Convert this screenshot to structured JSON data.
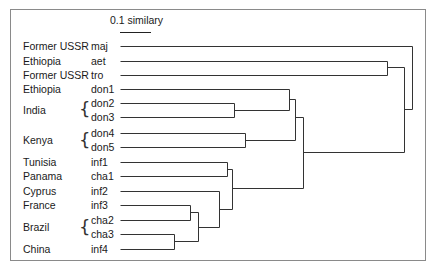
{
  "diagram": {
    "type": "dendrogram",
    "scale": {
      "label": "0.1 similary",
      "bar_length_px": 31
    },
    "leaves": [
      {
        "country": "Former USSR",
        "code": "maj"
      },
      {
        "country": "Ethiopia",
        "code": "aet"
      },
      {
        "country": "Former USSR",
        "code": "tro"
      },
      {
        "country": "Ethiopia",
        "code": "don1"
      },
      {
        "country": "",
        "code": "don2"
      },
      {
        "country": "",
        "code": "don3"
      },
      {
        "country": "",
        "code": "don4"
      },
      {
        "country": "",
        "code": "don5"
      },
      {
        "country": "Tunisia",
        "code": "inf1"
      },
      {
        "country": "Panama",
        "code": "cha1"
      },
      {
        "country": "Cyprus",
        "code": "inf2"
      },
      {
        "country": "France",
        "code": "inf3"
      },
      {
        "country": "",
        "code": "cha2"
      },
      {
        "country": "",
        "code": "cha3"
      },
      {
        "country": "China",
        "code": "inf4"
      }
    ],
    "group_labels": [
      {
        "country": "India",
        "codes": [
          "don2",
          "don3"
        ]
      },
      {
        "country": "Kenya",
        "codes": [
          "don4",
          "don5"
        ]
      },
      {
        "country": "Brazil",
        "codes": [
          "cha2",
          "cha3"
        ]
      }
    ],
    "clusters": [
      {
        "members": [
          "don2",
          "don3"
        ]
      },
      {
        "members": [
          "don1",
          "don2",
          "don3"
        ]
      },
      {
        "members": [
          "don4",
          "don5"
        ]
      },
      {
        "members": [
          "don1",
          "don2",
          "don3",
          "don4",
          "don5"
        ]
      },
      {
        "members": [
          "inf1",
          "cha1"
        ]
      },
      {
        "members": [
          "inf3",
          "cha2"
        ]
      },
      {
        "members": [
          "cha3",
          "inf4"
        ]
      },
      {
        "members": [
          "inf3",
          "cha2",
          "cha3",
          "inf4"
        ]
      },
      {
        "members": [
          "inf2",
          "inf3",
          "cha2",
          "cha3",
          "inf4"
        ]
      },
      {
        "members": [
          "inf1",
          "cha1",
          "inf2",
          "inf3",
          "cha2",
          "cha3",
          "inf4"
        ]
      },
      {
        "members": [
          "don1",
          "don2",
          "don3",
          "don4",
          "don5",
          "inf1",
          "cha1",
          "inf2",
          "inf3",
          "cha2",
          "cha3",
          "inf4"
        ]
      },
      {
        "members": [
          "aet",
          "tro"
        ]
      },
      {
        "members": [
          "aet",
          "tro",
          "don1",
          "don2",
          "don3",
          "don4",
          "don5",
          "inf1",
          "cha1",
          "inf2",
          "inf3",
          "cha2",
          "cha3",
          "inf4"
        ]
      },
      {
        "members": [
          "maj",
          "aet",
          "tro",
          "don1",
          "don2",
          "don3",
          "don4",
          "don5",
          "inf1",
          "cha1",
          "inf2",
          "inf3",
          "cha2",
          "cha3",
          "inf4"
        ]
      }
    ]
  }
}
